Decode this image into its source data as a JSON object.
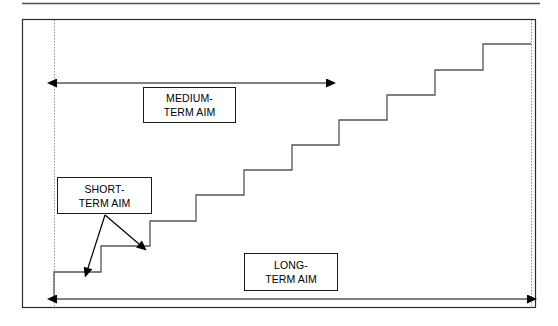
{
  "figure": {
    "title_rule": "top-divider",
    "colors": {
      "background": "#ffffff",
      "stroke": "#1a1a1a",
      "staircase": "#555555",
      "guide_line": "#999999",
      "text": "#000000"
    },
    "frame": {
      "x": 22,
      "y": 19,
      "width": 513,
      "height": 288
    },
    "guides": [
      {
        "name": "left-guide",
        "x": 54,
        "y1": 19,
        "y2": 307
      },
      {
        "name": "right-guide",
        "x": 531,
        "y1": 19,
        "y2": 307
      }
    ],
    "staircase": {
      "description": "ascending step function from lower-left to upper-right",
      "steps": [
        {
          "x1": 54,
          "x2": 101,
          "y": 272
        },
        {
          "x1": 101,
          "x2": 150,
          "y": 246
        },
        {
          "x1": 150,
          "x2": 196,
          "y": 221
        },
        {
          "x1": 196,
          "x2": 244,
          "y": 195
        },
        {
          "x1": 244,
          "x2": 292,
          "y": 170
        },
        {
          "x1": 292,
          "x2": 339,
          "y": 145
        },
        {
          "x1": 339,
          "x2": 387,
          "y": 120
        },
        {
          "x1": 387,
          "x2": 435,
          "y": 95
        },
        {
          "x1": 435,
          "x2": 483,
          "y": 70
        },
        {
          "x1": 483,
          "x2": 531,
          "y": 44
        }
      ],
      "start_y": 298,
      "step_count": 10
    },
    "arrows": {
      "medium": {
        "x1": 54,
        "x2": 329,
        "y": 83,
        "heads": "both"
      },
      "long": {
        "x1": 54,
        "x2": 530,
        "y": 299,
        "heads": "both"
      },
      "short_left": {
        "x1": 105,
        "y1": 215,
        "x2": 88,
        "y2": 272,
        "heads": "end"
      },
      "short_right": {
        "x1": 105,
        "y1": 215,
        "x2": 142,
        "y2": 247,
        "heads": "end"
      }
    }
  },
  "labels": {
    "medium": {
      "line1": "MEDIUM-",
      "line2": "TERM AIM"
    },
    "short": {
      "line1": "SHORT-",
      "line2": "TERM AIM"
    },
    "long": {
      "line1": "LONG-",
      "line2": "TERM AIM"
    }
  }
}
